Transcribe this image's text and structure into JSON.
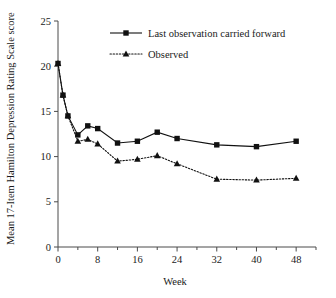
{
  "chart_data": {
    "type": "line",
    "title": "",
    "xlabel": "Week",
    "ylabel": "Mean 17-Item Hamilton Depression Rating Scale score",
    "xlim": [
      0,
      52
    ],
    "ylim": [
      0,
      25
    ],
    "xticks": [
      0,
      8,
      16,
      24,
      32,
      40,
      48
    ],
    "xtick_labels": [
      "0",
      "8",
      "16",
      "24",
      "32",
      "40",
      "48"
    ],
    "xminor_ticks": [
      4,
      12,
      20,
      28,
      36,
      44,
      52
    ],
    "yticks": [
      0,
      5,
      10,
      15,
      20,
      25
    ],
    "ytick_labels": [
      "0",
      "5",
      "10",
      "15",
      "20",
      "25"
    ],
    "grid": false,
    "legend_position": "top-center",
    "series": [
      {
        "name": "Last observation carried forward",
        "marker": "square",
        "linestyle": "solid",
        "color": "#111111",
        "x": [
          0,
          1,
          2,
          4,
          6,
          8,
          12,
          16,
          20,
          24,
          32,
          40,
          48
        ],
        "values": [
          20.3,
          16.8,
          14.5,
          12.4,
          13.4,
          13.1,
          11.5,
          11.7,
          12.7,
          12.0,
          11.3,
          11.1,
          11.7
        ]
      },
      {
        "name": "Observed",
        "marker": "triangle",
        "linestyle": "dotted",
        "color": "#111111",
        "x": [
          0,
          1,
          2,
          4,
          6,
          8,
          12,
          16,
          20,
          24,
          32,
          40,
          48
        ],
        "values": [
          20.3,
          16.8,
          14.5,
          11.7,
          11.9,
          11.4,
          9.5,
          9.7,
          10.1,
          9.2,
          7.5,
          7.4,
          7.6
        ]
      }
    ]
  },
  "legend": {
    "items": [
      {
        "label": "Last observation carried forward",
        "marker": "square-marker",
        "line": "solid-line"
      },
      {
        "label": "Observed",
        "marker": "triangle-marker",
        "line": "dotted-line"
      }
    ]
  },
  "axes": {
    "y_title": "Mean 17-Item Hamilton Depression Rating Scale score",
    "x_title": "Week"
  },
  "colors": {
    "ink": "#111111",
    "axis": "#4a4a4a",
    "background": "#ffffff"
  }
}
